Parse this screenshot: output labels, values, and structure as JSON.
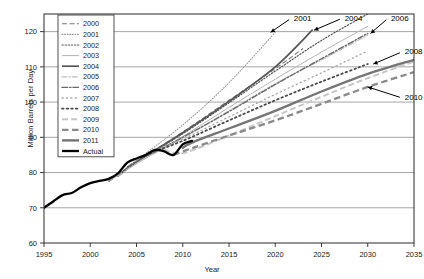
{
  "chart_data": {
    "type": "line",
    "title": "",
    "xlabel": "Year",
    "ylabel": "Million Barrels per Day",
    "xlim": [
      1995,
      2035
    ],
    "ylim": [
      60,
      125
    ],
    "xticks": [
      "1995",
      "2000",
      "2005",
      "2010",
      "2015",
      "2020",
      "2025",
      "2030",
      "2035"
    ],
    "xtick_values": [
      1995,
      2000,
      2005,
      2010,
      2015,
      2020,
      2025,
      2030,
      2035
    ],
    "yticks": [
      "60",
      "70",
      "80",
      "90",
      "100",
      "110",
      "120"
    ],
    "ytick_values": [
      60,
      70,
      80,
      90,
      100,
      110,
      120
    ],
    "grid": "horizontal",
    "legend_position": "upper-left-inside",
    "annotations": [
      {
        "label": "2001",
        "x": 2022.0,
        "y": 124.0,
        "point_x": 2019.5,
        "point_y": 119.8
      },
      {
        "label": "2004",
        "x": 2027.5,
        "y": 124.0,
        "point_x": 2024.2,
        "point_y": 120.4
      },
      {
        "label": "2006",
        "x": 2032.5,
        "y": 124.0,
        "point_x": 2030.3,
        "point_y": 119.5
      },
      {
        "label": "2008",
        "x": 2034.0,
        "y": 114.5,
        "point_x": 2030.6,
        "point_y": 110.8
      },
      {
        "label": "2010",
        "x": 2034.0,
        "y": 101.5,
        "point_x": 2030.0,
        "point_y": 104.3
      }
    ],
    "series": [
      {
        "name": "2000",
        "style": "dashed",
        "color": "#7a7a7a",
        "width": 1.1,
        "dash": "5,2.5",
        "x": [
          2002,
          2005,
          2010,
          2015,
          2020,
          2023
        ],
        "y": [
          77.5,
          83.0,
          91.5,
          100.5,
          109.5,
          115.2
        ]
      },
      {
        "name": "2001",
        "style": "fine-dotted",
        "color": "#9a9a9a",
        "width": 1.1,
        "dash": "0.8,1.8",
        "x": [
          2002,
          2005,
          2010,
          2015,
          2020
        ],
        "y": [
          77.5,
          83.5,
          93.5,
          105.5,
          119.8
        ]
      },
      {
        "name": "2002",
        "style": "dotted",
        "color": "#555555",
        "width": 1.2,
        "dash": "1.3,1.8",
        "x": [
          2002,
          2005,
          2010,
          2015,
          2020,
          2025,
          2030
        ],
        "y": [
          77.5,
          83.0,
          91.0,
          99.8,
          108.8,
          117.5,
          125.0
        ]
      },
      {
        "name": "2003",
        "style": "thin-solid",
        "color": "#b4b4b4",
        "width": 1.0,
        "dash": "none",
        "x": [
          2002,
          2005,
          2010,
          2015,
          2020,
          2025,
          2030
        ],
        "y": [
          77.5,
          82.5,
          90.2,
          98.5,
          106.5,
          114.2,
          121.5
        ]
      },
      {
        "name": "2004",
        "style": "solid",
        "color": "#555555",
        "width": 1.7,
        "dash": "none",
        "x": [
          2003,
          2005,
          2010,
          2015,
          2020,
          2024
        ],
        "y": [
          79.0,
          83.0,
          91.3,
          100.2,
          110.0,
          120.4
        ]
      },
      {
        "name": "2005",
        "style": "dash-dot-light",
        "color": "#bdbdbd",
        "width": 1.2,
        "dash": "5,2,1.2,2",
        "x": [
          2003,
          2005,
          2010,
          2015,
          2020,
          2025,
          2030
        ],
        "y": [
          79.0,
          82.6,
          89.8,
          97.5,
          105.2,
          112.0,
          119.0
        ]
      },
      {
        "name": "2006",
        "style": "dash-dot",
        "color": "#6a6a6a",
        "width": 1.4,
        "dash": "5.5,2,1.5,2",
        "x": [
          2004,
          2005,
          2010,
          2015,
          2020,
          2025,
          2030
        ],
        "y": [
          81.5,
          83.2,
          90.0,
          97.3,
          105.0,
          112.3,
          119.5
        ]
      },
      {
        "name": "2007",
        "style": "sparse-dots",
        "color": "#a8a8a8",
        "width": 1.3,
        "dash": "1.2,3.2",
        "x": [
          2005,
          2010,
          2015,
          2020,
          2025,
          2030
        ],
        "y": [
          84.0,
          89.5,
          95.8,
          102.2,
          108.3,
          114.5
        ]
      },
      {
        "name": "2008",
        "style": "dots",
        "color": "#4a4a4a",
        "width": 1.8,
        "dash": "1.6,3",
        "x": [
          2006,
          2010,
          2015,
          2020,
          2025,
          2030
        ],
        "y": [
          85.0,
          89.0,
          94.8,
          100.5,
          105.8,
          110.8
        ]
      },
      {
        "name": "2009",
        "style": "dashed-light",
        "color": "#c6c6c6",
        "width": 2.0,
        "dash": "6,3",
        "x": [
          2008,
          2010,
          2015,
          2020,
          2025,
          2030,
          2035
        ],
        "y": [
          86.5,
          85.5,
          90.5,
          96.0,
          101.5,
          106.8,
          111.5
        ]
      },
      {
        "name": "2010",
        "style": "thick-dashed",
        "color": "#8a8a8a",
        "width": 2.3,
        "dash": "6.5,3.5",
        "x": [
          2009,
          2010,
          2015,
          2020,
          2025,
          2030,
          2035
        ],
        "y": [
          85.0,
          86.0,
          90.5,
          94.8,
          99.5,
          104.3,
          108.5
        ]
      },
      {
        "name": "2011",
        "style": "thick-solid",
        "color": "#757575",
        "width": 2.4,
        "dash": "none",
        "x": [
          2010,
          2011,
          2015,
          2020,
          2025,
          2030,
          2035
        ],
        "y": [
          87.0,
          88.5,
          92.5,
          97.5,
          103.0,
          108.0,
          112.0
        ]
      },
      {
        "name": "Actual",
        "style": "thick-solid-black",
        "color": "#000000",
        "width": 2.3,
        "dash": "none",
        "x": [
          1995,
          1996,
          1997,
          1998,
          1999,
          2000,
          2001,
          2002,
          2003,
          2004,
          2005,
          2006,
          2007,
          2008,
          2009,
          2010,
          2011
        ],
        "y": [
          70.0,
          71.8,
          73.6,
          74.2,
          75.8,
          77.0,
          77.6,
          78.2,
          79.8,
          82.8,
          84.0,
          85.0,
          86.4,
          86.0,
          85.0,
          88.0,
          89.0
        ]
      }
    ]
  },
  "legend": {
    "items": [
      {
        "label": "2000"
      },
      {
        "label": "2001"
      },
      {
        "label": "2002"
      },
      {
        "label": "2003"
      },
      {
        "label": "2004"
      },
      {
        "label": "2005"
      },
      {
        "label": "2006"
      },
      {
        "label": "2007"
      },
      {
        "label": "2008"
      },
      {
        "label": "2009"
      },
      {
        "label": "2010"
      },
      {
        "label": "2011"
      },
      {
        "label": "Actual"
      }
    ]
  },
  "colors": {
    "axis": "#3c3c3c",
    "grid": "#808080",
    "background": "#ffffff",
    "text": "#1a1a1a"
  }
}
